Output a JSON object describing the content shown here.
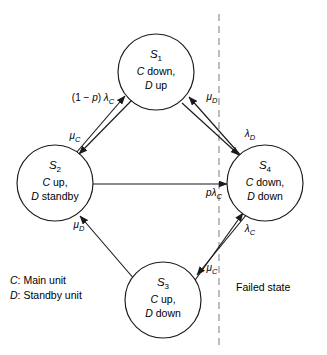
{
  "diagram": {
    "states": [
      {
        "id": "S",
        "index": "1",
        "line1": "C down,",
        "line2": "D up",
        "cx": 156,
        "cy": 72,
        "r": 38
      },
      {
        "id": "S",
        "index": "2",
        "line1": "C up,",
        "line2": "D standby",
        "cx": 55,
        "cy": 183,
        "r": 38
      },
      {
        "id": "S",
        "index": "4",
        "line1": "C down,",
        "line2": "D down",
        "cx": 265,
        "cy": 183,
        "r": 38
      },
      {
        "id": "S",
        "index": "3",
        "line1": "C up,",
        "line2": "D down",
        "cx": 163,
        "cy": 300,
        "r": 38
      }
    ],
    "transitions": [
      {
        "name": "s2-to-s1",
        "from": "S2",
        "to": "S1",
        "label_prefix": "(1 − ",
        "label_italic": "p",
        "label_mid": ") λ",
        "label_sub": "C",
        "label_x": 93,
        "label_y": 101
      },
      {
        "name": "s1-to-s2",
        "from": "S1",
        "to": "S2",
        "label_prefix": "",
        "label_italic": "",
        "label_mid": "μ",
        "label_sub": "C",
        "label_x": 75,
        "label_y": 139
      },
      {
        "name": "s4-to-s1",
        "from": "S4",
        "to": "S1",
        "label_prefix": "",
        "label_italic": "",
        "label_mid": "μ",
        "label_sub": "D",
        "label_x": 212,
        "label_y": 100
      },
      {
        "name": "s1-to-s4",
        "from": "S1",
        "to": "S4",
        "label_prefix": "",
        "label_italic": "",
        "label_mid": "λ",
        "label_sub": "D",
        "label_x": 250,
        "label_y": 137
      },
      {
        "name": "s2-to-s4",
        "from": "S2",
        "to": "S4",
        "label_prefix": "",
        "label_italic": "p",
        "label_mid": "λ",
        "label_sub": "C",
        "label_x": 214,
        "label_y": 196
      },
      {
        "name": "s3-to-s2",
        "from": "S3",
        "to": "S2",
        "label_prefix": "",
        "label_italic": "",
        "label_mid": "μ",
        "label_sub": "D",
        "label_x": 79,
        "label_y": 228
      },
      {
        "name": "s3-to-s4",
        "from": "S3",
        "to": "S4",
        "label_prefix": "",
        "label_italic": "",
        "label_mid": "λ",
        "label_sub": "C",
        "label_x": 250,
        "label_y": 232
      },
      {
        "name": "s4-to-s3",
        "from": "S4",
        "to": "S3",
        "label_prefix": "",
        "label_italic": "",
        "label_mid": "μ",
        "label_sub": "C",
        "label_x": 212,
        "label_y": 271
      }
    ],
    "legend": [
      {
        "symbol": "C",
        "text": ": Main unit"
      },
      {
        "symbol": "D",
        "text": ": Standby unit"
      }
    ],
    "region_label": "Failed state",
    "divider": {
      "x": 219,
      "y_top": 14,
      "y_bottom": 348
    },
    "colors": {
      "stroke": "#1a1a1a",
      "divider": "#9a9a9a",
      "background": "#ffffff"
    }
  }
}
